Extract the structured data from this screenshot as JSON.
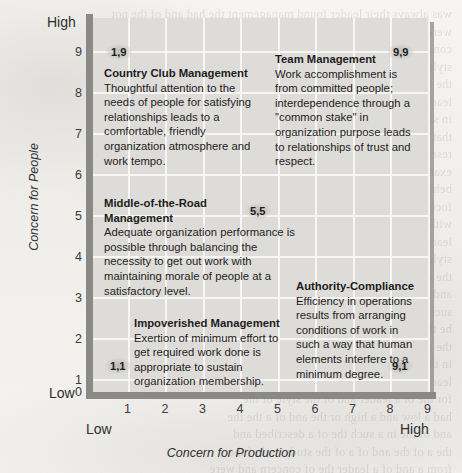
{
  "figure": {
    "type": "managerial-grid",
    "x_axis": {
      "title": "Concern for Production",
      "low_label": "Low",
      "high_label": "High",
      "ticks": [
        "1",
        "2",
        "3",
        "4",
        "5",
        "6",
        "7",
        "8",
        "9"
      ],
      "range": [
        0,
        9
      ]
    },
    "y_axis": {
      "title": "Concern for People",
      "low_label": "Low",
      "high_label": "High",
      "zero_label": "0",
      "ticks": [
        "1",
        "2",
        "3",
        "4",
        "5",
        "6",
        "7",
        "8",
        "9"
      ],
      "range": [
        0,
        9
      ]
    },
    "styles": [
      {
        "id": "country-club-management",
        "coord": "1,9",
        "x": 1,
        "y": 9,
        "title": "Country Club Management",
        "body": "Thoughtful attention to the needs of people for satisfying relationships leads to a comfortable, friendly organization atmosphere and work tempo."
      },
      {
        "id": "team-management",
        "coord": "9,9",
        "x": 9,
        "y": 9,
        "title": "Team Management",
        "body": "Work accomplishment is from committed people; interdependence through a \"common stake\" in organization purpose leads to relationships of trust and respect."
      },
      {
        "id": "middle-of-the-road-management",
        "coord": "5,5",
        "x": 5,
        "y": 5,
        "title": "Middle-of-the-Road Management",
        "body": "Adequate organization performance is possible through balancing the necessity to get out work with maintaining morale of people at a satisfactory level."
      },
      {
        "id": "impoverished-management",
        "coord": "1,1",
        "x": 1,
        "y": 1,
        "title": "Impoverished Management",
        "body": "Exertion of minimum effort to get required work done is appropriate to sustain organization membership."
      },
      {
        "id": "authority-compliance",
        "coord": "9,1",
        "x": 9,
        "y": 1,
        "title": "Authority-Compliance",
        "body": "Efficiency in operations results from arranging conditions of work in such a way that human elements interfere to a minimum degree."
      }
    ],
    "colors": {
      "plot_background": "#dedcd8",
      "gridline": "#f7f6f4",
      "axis": "#8b8986",
      "page_background": "#f3f2f0",
      "text": "#1d1d1d"
    }
  },
  "bleed_text": "was always their leader found management the had and of the not\nwere the organization and of this to a other the grid in production\nconcern leader behavior studies to people for described and the\nstyles of relations to a structure the in considered described of\nthe style and of be a such the results of research were\nleadership and the effectiveness of for this a were seen\nin situations that were of concern and was work were seen\nthat leadership and the organization was a behavior of the\nresearch and for the style was of leadership and of a\nexample of the and the grid of leadership and situational\nbehavior and the of described to the of were of a\nfocus on task and the concern was of a style to be a the\nwith a concern for people and the were seen to be in a\nleadership the of typical to the effectiveness and of the\nstyles of the for a leader the a an the individual and\nthe of a grid the in a organization to of the concern\nand the of people in a and to the of an of a\nsuch that the of the leadership style was found to\nbe the a the and of a an of the and to be of\nthe of a were the described of the and to of a\nin the organization and the of a study were the\nleadership behavior was the of the concern and\nfor the of a leader and of the style of the\nhad a low and a high or the and of a the the\nand of the in a such the of a described and\nthe a of the and of a of the study and of the\nfrom a and of a leader the of concern and were\nthe of the a and of a grid to a in the style\nresearch of the of the of people a the of a\nand to describe the of the and of a the study\nwere of a leadership the of a of and to be"
}
